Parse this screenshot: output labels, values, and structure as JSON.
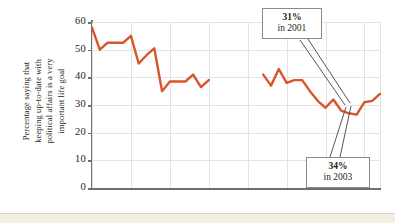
{
  "chart_data": {
    "type": "line",
    "title": "",
    "xlabel": "",
    "ylabel": "Percentage saying that keeping up-to-date with political affairs is a very important life goal",
    "ylabel_lines": [
      "Percentage saying that",
      "keeping up-to-date with",
      "political affairs is a very",
      "important life goal"
    ],
    "ylim": [
      0,
      60
    ],
    "yticks": [
      0,
      10,
      20,
      30,
      40,
      50,
      60
    ],
    "ytick_labels": [
      "0",
      "10",
      "20",
      "30",
      "40",
      "50",
      "60"
    ],
    "xlim": [
      1966,
      2003
    ],
    "xticks": [
      1966,
      1971,
      1976,
      1981,
      1986,
      1991,
      1996,
      2001,
      2003
    ],
    "xtick_labels": [
      "'66",
      "'71",
      "'76",
      "'81",
      "'86",
      "'91",
      "'96",
      "'01",
      "'03"
    ],
    "grid": "both",
    "legend": "none",
    "line_color": "#d9552a",
    "series": [
      {
        "name": "segment-1",
        "x": [
          1966,
          1967,
          1968,
          1969,
          1970,
          1971,
          1972,
          1973,
          1974,
          1975,
          1976,
          1977,
          1978,
          1979,
          1980,
          1981
        ],
        "values": [
          58,
          50,
          52.5,
          52.5,
          52.5,
          55,
          45,
          48,
          50.5,
          35,
          38.5,
          38.5,
          38.5,
          41,
          36.5,
          39
        ]
      },
      {
        "name": "segment-2",
        "x": [
          1988,
          1989,
          1990,
          1991,
          1992,
          1993,
          1994,
          1995,
          1996,
          1997,
          1998,
          1999,
          2000,
          2001,
          2002,
          2003
        ],
        "values": [
          41,
          37,
          43,
          38,
          39,
          39,
          35,
          31.5,
          29,
          32,
          28,
          27,
          26.5,
          31,
          31.5,
          34
        ]
      }
    ],
    "annotations": [
      {
        "id": "callout-2001",
        "line1": "31%",
        "line2": "in 2001",
        "value": 31,
        "year": 2001
      },
      {
        "id": "callout-2003",
        "line1": "34%",
        "line2": "in 2003",
        "value": 34,
        "year": 2003
      }
    ]
  }
}
